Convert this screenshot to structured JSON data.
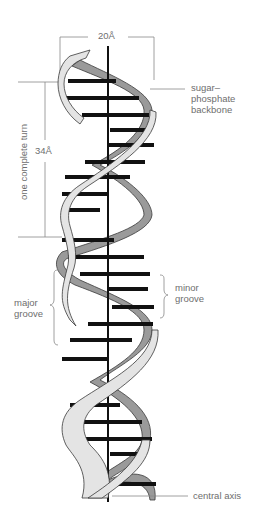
{
  "diagram": {
    "colors": {
      "front_strand": "#e4e4e4",
      "back_strand": "#9a9a9a",
      "outline": "#3a3a3a",
      "base_pair": "#111111",
      "axis": "#111111",
      "label_text": "#6e6e6e",
      "leader_line": "#888888"
    },
    "labels": {
      "width": "20Å",
      "pitch": "34Å",
      "turn": "one complete turn",
      "backbone_line1": "sugar–",
      "backbone_line2": "phosphate",
      "backbone_line3": "backbone",
      "major_line1": "major",
      "major_line2": "groove",
      "minor_line1": "minor",
      "minor_line2": "groove",
      "axis": "central axis"
    }
  }
}
